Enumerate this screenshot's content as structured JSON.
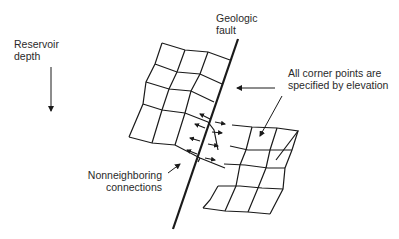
{
  "labels": {
    "reservoir_depth": [
      "Reservoir",
      "depth"
    ],
    "geologic_fault": [
      "Geologic",
      "fault"
    ],
    "corner_points": [
      "All corner points are",
      "specified by elevation"
    ],
    "nonneighboring": [
      "Nonneighboring",
      "connections"
    ]
  },
  "colors": {
    "line": "#1a1a1a",
    "text": "#2a2a2a",
    "background": "#ffffff"
  }
}
